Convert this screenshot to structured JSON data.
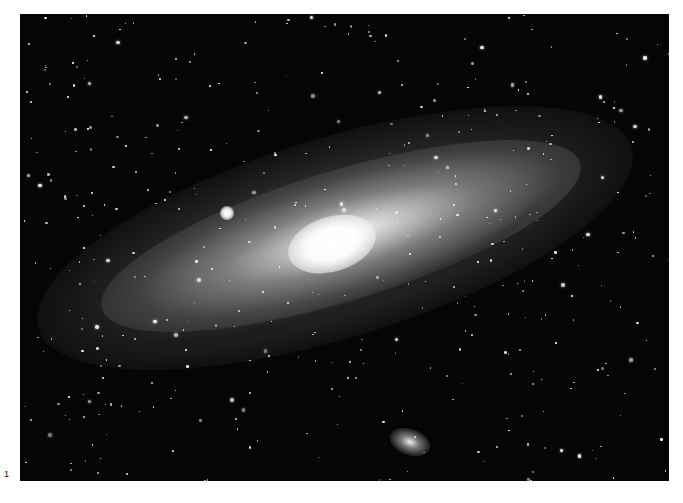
{
  "figure": {
    "label": "1",
    "style": "grayscale astrophotograph",
    "colors": {
      "sky": "#050505",
      "stars": "#ffffff",
      "page_background": "#ffffff",
      "label_text": "#111111"
    }
  },
  "elements": {
    "main_galaxy": {
      "icon": "spiral-galaxy",
      "orientation_deg": -17
    },
    "companion_upper_left": {
      "icon": "bright-compact-galaxy"
    },
    "companion_lower": {
      "icon": "elliptical-galaxy"
    }
  },
  "starfield": {
    "count": 420,
    "seed": 31
  }
}
